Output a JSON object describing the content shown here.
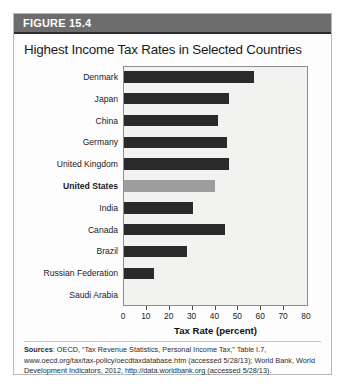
{
  "figure": {
    "header_label": "FIGURE 15.4",
    "title": "Highest Income Tax Rates in Selected Countries"
  },
  "source": {
    "prefix": "Sources",
    "text": ": OECD, “Tax Revenue Statistics, Personal Income Tax,” Table I.7, www.oecd.org/tax/tax-policy/oecdtaxdatabase.htm (accessed 5/28/13); World Bank, World Development Indicators, 2012, http://data.worldbank.org (accessed 5/28/13)."
  },
  "colors": {
    "bar": "#2a2a2a",
    "bar_highlight": "#9d9d9d",
    "header_band": "#6d6d6d",
    "plot_background": "#f2f2f0"
  },
  "chart_data": {
    "type": "bar",
    "orientation": "horizontal",
    "title": "Highest Income Tax Rates in Selected Countries",
    "xlabel": "Tax Rate (percent)",
    "ylabel": "",
    "xlim": [
      0,
      80
    ],
    "xticks": [
      0,
      10,
      20,
      30,
      40,
      50,
      60,
      70,
      80
    ],
    "grid": false,
    "legend": false,
    "highlight_category": "United States",
    "categories": [
      "Denmark",
      "Japan",
      "China",
      "Germany",
      "United Kingdom",
      "United States",
      "India",
      "Canada",
      "Brazil",
      "Russian Federation",
      "Saudi Arabia"
    ],
    "values": [
      57,
      46,
      41,
      45,
      46,
      39.6,
      30,
      44,
      27.5,
      13,
      0
    ],
    "bars": [
      {
        "label": "Denmark",
        "value": 57,
        "highlight": false
      },
      {
        "label": "Japan",
        "value": 46,
        "highlight": false
      },
      {
        "label": "China",
        "value": 41,
        "highlight": false
      },
      {
        "label": "Germany",
        "value": 45,
        "highlight": false
      },
      {
        "label": "United Kingdom",
        "value": 46,
        "highlight": false
      },
      {
        "label": "United States",
        "value": 39.6,
        "highlight": true
      },
      {
        "label": "India",
        "value": 30,
        "highlight": false
      },
      {
        "label": "Canada",
        "value": 44,
        "highlight": false
      },
      {
        "label": "Brazil",
        "value": 27.5,
        "highlight": false
      },
      {
        "label": "Russian Federation",
        "value": 13,
        "highlight": false
      },
      {
        "label": "Saudi Arabia",
        "value": 0,
        "highlight": false
      }
    ]
  }
}
